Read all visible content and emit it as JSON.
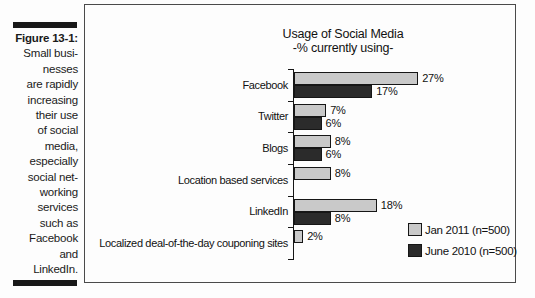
{
  "figure_caption": {
    "label": "Figure 13-1:",
    "lines": [
      "Small busi-",
      "nesses",
      "are rapidly",
      "increasing",
      "their use",
      "of social",
      "media,",
      "especially",
      "social net-",
      "working",
      "services",
      "such as",
      "Facebook",
      "and",
      "LinkedIn."
    ]
  },
  "chart_data": {
    "type": "bar",
    "orientation": "horizontal",
    "title": "Usage of Social Media",
    "subtitle": "-% currently using-",
    "categories": [
      "Facebook",
      "Twitter",
      "Blogs",
      "Location based services",
      "LinkedIn",
      "Localized deal-of-the-day couponing sites"
    ],
    "series": [
      {
        "name": "Jan 2011 (n=500)",
        "color": "#c9c9c9",
        "values": [
          27,
          7,
          8,
          8,
          18,
          2
        ]
      },
      {
        "name": "June 2010 (n=500)",
        "color": "#2b2b2b",
        "values": [
          17,
          6,
          6,
          null,
          8,
          null
        ]
      }
    ],
    "value_suffix": "%",
    "xlim": [
      0,
      48
    ],
    "grid": false,
    "legend_position": "bottom-right",
    "accent_colors": {
      "frame": "#4a4a4a",
      "axis": "#161616",
      "rule_bars": "#181818"
    }
  }
}
